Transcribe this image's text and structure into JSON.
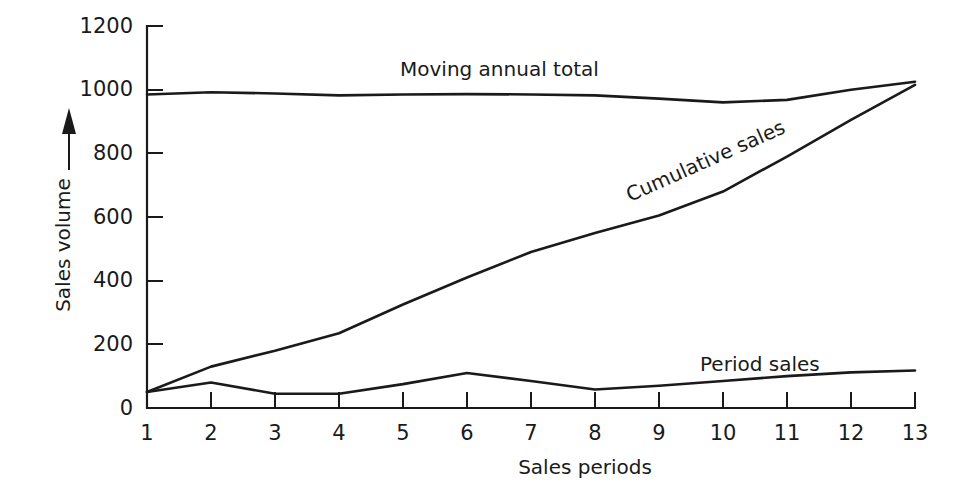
{
  "chart_data": {
    "type": "line",
    "title": "",
    "xlabel": "Sales periods",
    "ylabel": "Sales volume",
    "x": [
      1,
      2,
      3,
      4,
      5,
      6,
      7,
      8,
      9,
      10,
      11,
      12,
      13
    ],
    "xlim": [
      1,
      13
    ],
    "ylim": [
      0,
      1200
    ],
    "ytick_labels": [
      "0",
      "200",
      "400",
      "600",
      "800",
      "1000",
      "1200"
    ],
    "yticks": [
      0,
      200,
      400,
      600,
      800,
      1000,
      1200
    ],
    "xtick_labels": [
      "1",
      "2",
      "3",
      "4",
      "5",
      "6",
      "7",
      "8",
      "9",
      "10",
      "11",
      "12",
      "13"
    ],
    "grid": false,
    "legend_position": "inline-annotations",
    "series": [
      {
        "name": "Moving annual total",
        "label_position": "above-line-near-period-5",
        "values": [
          985,
          992,
          988,
          982,
          985,
          986,
          985,
          982,
          972,
          960,
          968,
          1000,
          1025
        ]
      },
      {
        "name": "Cumulative sales",
        "label_position": "rotated-along-line-near-period-9",
        "values": [
          50,
          130,
          180,
          235,
          325,
          410,
          490,
          550,
          605,
          680,
          790,
          905,
          1015
        ]
      },
      {
        "name": "Period sales",
        "label_position": "above-line-near-period-11",
        "values": [
          50,
          80,
          45,
          45,
          75,
          110,
          85,
          58,
          70,
          85,
          100,
          112,
          118
        ]
      }
    ]
  },
  "annotations": {
    "moving_annual_total": "Moving annual total",
    "cumulative_sales": "Cumulative sales",
    "period_sales": "Period sales"
  },
  "axes": {
    "x_axis_title": "Sales periods",
    "y_axis_title": "Sales volume"
  }
}
